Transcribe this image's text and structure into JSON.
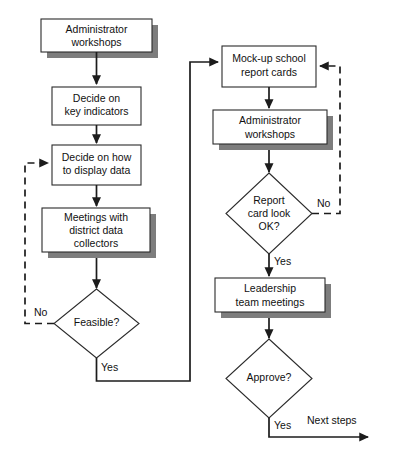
{
  "diagram": {
    "colors": {
      "stroke": "#1c1c1c",
      "box_fill": "#ffffff",
      "shadow": "#7d7d7d",
      "text": "#111111"
    },
    "nodes": {
      "admin_workshops_1": {
        "type": "process",
        "line1": "Administrator",
        "line2": "workshops"
      },
      "key_indicators": {
        "type": "process",
        "line1": "Decide on",
        "line2": "key indicators"
      },
      "display_data": {
        "type": "process",
        "line1": "Decide on how",
        "line2": "to display data"
      },
      "meetings": {
        "type": "process",
        "line1": "Meetings with",
        "line2": "district data",
        "line3": "collectors"
      },
      "feasible": {
        "type": "decision",
        "line1": "Feasible?"
      },
      "mockup_cards": {
        "type": "process",
        "line1": "Mock-up school",
        "line2": "report cards"
      },
      "admin_workshops_2": {
        "type": "process",
        "line1": "Administrator",
        "line2": "workshops"
      },
      "report_card_ok": {
        "type": "decision",
        "line1": "Report",
        "line2": "card look",
        "line3": "OK?"
      },
      "leadership_meetings": {
        "type": "process",
        "line1": "Leadership",
        "line2": "team meetings"
      },
      "approve": {
        "type": "decision",
        "line1": "Approve?"
      }
    },
    "edge_labels": {
      "feasible_no": "No",
      "feasible_yes": "Yes",
      "report_no": "No",
      "report_yes": "Yes",
      "approve_yes": "Yes"
    },
    "terminals": {
      "next_steps": "Next steps"
    }
  }
}
